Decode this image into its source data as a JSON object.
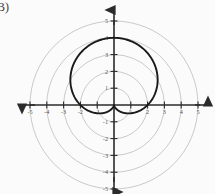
{
  "figure": {
    "part_label": "B)",
    "background_color": "#fbfbfb"
  },
  "chart_data": {
    "type": "line",
    "plot_kind": "polar",
    "title": "",
    "xlabel": "",
    "ylabel": "",
    "xlim": [
      -5.8,
      5.8
    ],
    "ylim": [
      -5.6,
      5.4
    ],
    "grid": true,
    "grid_style": "polar-concentric-circles",
    "grid_color": "#a8a8a8",
    "grid_radii": [
      1,
      2,
      3,
      4,
      5
    ],
    "axis_color": "#2b2b2b",
    "curve_color": "#1a1a1a",
    "legend_position": "none",
    "x_ticks": [
      -5,
      -4,
      -3,
      -2,
      -1,
      1,
      2,
      3,
      4,
      5
    ],
    "x_tick_labels": [
      "-5",
      "-4",
      "-3",
      "-2",
      "-1",
      "1",
      "2",
      "3",
      "4",
      "5"
    ],
    "y_ticks": [
      -5,
      -4,
      -3,
      -2,
      -1,
      1,
      2,
      3,
      4,
      5
    ],
    "y_tick_labels": [
      "-5",
      "-4",
      "-3",
      "-2",
      "-1",
      "1",
      "2",
      "3",
      "4",
      "5"
    ],
    "series": [
      {
        "name": "cardioid",
        "equation": "r = 2(1 + sin(theta))",
        "r_max": 4,
        "cusp": [
          0,
          0
        ],
        "extreme_points": {
          "top": [
            0,
            4
          ],
          "left": [
            -2.6,
            1.5
          ],
          "right": [
            2.6,
            1.5
          ],
          "bottom_cusp": [
            0,
            0
          ]
        },
        "theta_values": [
          0,
          15,
          30,
          45,
          60,
          75,
          90,
          105,
          120,
          135,
          150,
          165,
          180,
          195,
          210,
          225,
          240,
          255,
          270,
          285,
          300,
          315,
          330,
          345,
          360
        ],
        "r_values": [
          2.0,
          2.52,
          3.0,
          3.41,
          3.73,
          3.93,
          4.0,
          3.93,
          3.73,
          3.41,
          3.0,
          2.52,
          2.0,
          1.48,
          1.0,
          0.59,
          0.27,
          0.07,
          0.0,
          0.07,
          0.27,
          0.59,
          1.0,
          1.48,
          2.0
        ]
      }
    ]
  }
}
